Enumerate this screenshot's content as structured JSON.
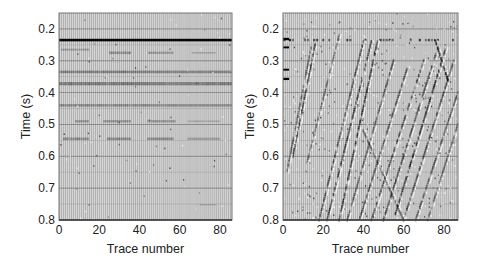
{
  "chart_data": [
    {
      "type": "heatmap",
      "subtype": "seismic-wiggle-section",
      "title": "",
      "xlabel": "Trace number",
      "ylabel": "Time (s)",
      "xlim": [
        0,
        86
      ],
      "ylim": [
        0.15,
        0.8
      ],
      "y_inverted": true,
      "xticks": [
        0,
        20,
        40,
        60,
        80
      ],
      "xtick_labels": [
        "0",
        "20",
        "40",
        "60",
        "80"
      ],
      "yticks": [
        0.2,
        0.3,
        0.4,
        0.5,
        0.6,
        0.7,
        0.8
      ],
      "ytick_labels": [
        "0.2",
        "0.3",
        "0.4",
        "0.5",
        "0.6",
        "0.7",
        "0.8"
      ],
      "grid": true,
      "description": "Flat (horizontal) reflection events",
      "events": [
        {
          "kind": "horizontal",
          "t": 0.235,
          "x0": 0,
          "x1": 86,
          "strength": 1.0,
          "thickness": 0.008
        },
        {
          "kind": "horizontal",
          "t": 0.265,
          "x0": 1,
          "x1": 15,
          "strength": 0.45,
          "thickness": 0.006
        },
        {
          "kind": "horizontal",
          "t": 0.275,
          "x0": 25,
          "x1": 36,
          "strength": 0.55,
          "thickness": 0.008
        },
        {
          "kind": "horizontal",
          "t": 0.275,
          "x0": 44,
          "x1": 57,
          "strength": 0.5,
          "thickness": 0.007
        },
        {
          "kind": "horizontal",
          "t": 0.275,
          "x0": 66,
          "x1": 78,
          "strength": 0.35,
          "thickness": 0.005
        },
        {
          "kind": "horizontal",
          "t": 0.335,
          "x0": 0,
          "x1": 86,
          "strength": 0.7,
          "thickness": 0.008
        },
        {
          "kind": "horizontal",
          "t": 0.372,
          "x0": 0,
          "x1": 86,
          "strength": 0.75,
          "thickness": 0.01
        },
        {
          "kind": "horizontal",
          "t": 0.44,
          "x0": 0,
          "x1": 86,
          "strength": 0.6,
          "thickness": 0.008
        },
        {
          "kind": "horizontal",
          "t": 0.49,
          "x0": 8,
          "x1": 15,
          "strength": 0.55,
          "thickness": 0.007
        },
        {
          "kind": "horizontal",
          "t": 0.49,
          "x0": 22,
          "x1": 36,
          "strength": 0.55,
          "thickness": 0.007
        },
        {
          "kind": "horizontal",
          "t": 0.49,
          "x0": 44,
          "x1": 58,
          "strength": 0.55,
          "thickness": 0.007
        },
        {
          "kind": "horizontal",
          "t": 0.49,
          "x0": 64,
          "x1": 80,
          "strength": 0.35,
          "thickness": 0.005
        },
        {
          "kind": "horizontal",
          "t": 0.545,
          "x0": 2,
          "x1": 15,
          "strength": 0.6,
          "thickness": 0.008
        },
        {
          "kind": "horizontal",
          "t": 0.545,
          "x0": 24,
          "x1": 36,
          "strength": 0.6,
          "thickness": 0.008
        },
        {
          "kind": "horizontal",
          "t": 0.545,
          "x0": 44,
          "x1": 57,
          "strength": 0.6,
          "thickness": 0.008
        },
        {
          "kind": "horizontal",
          "t": 0.545,
          "x0": 64,
          "x1": 80,
          "strength": 0.45,
          "thickness": 0.007
        },
        {
          "kind": "horizontal",
          "t": 0.752,
          "x0": 70,
          "x1": 78,
          "strength": 0.35,
          "thickness": 0.004
        }
      ]
    },
    {
      "type": "heatmap",
      "subtype": "seismic-wiggle-section",
      "title": "",
      "xlabel": "Trace number",
      "ylabel": "Time (s)",
      "xlim": [
        0,
        87
      ],
      "ylim": [
        0.15,
        0.8
      ],
      "y_inverted": true,
      "xticks": [
        0,
        20,
        40,
        60,
        80
      ],
      "xtick_labels": [
        "0",
        "20",
        "40",
        "60",
        "80"
      ],
      "yticks": [
        0.2,
        0.3,
        0.4,
        0.5,
        0.6,
        0.7,
        0.8
      ],
      "ytick_labels": [
        "0.2",
        "0.3",
        "0.4",
        "0.5",
        "0.6",
        "0.7",
        "0.8"
      ],
      "grid": true,
      "description": "Dipping (linear) coherent noise events with flat first break near 0.235 s",
      "events": [
        {
          "kind": "horizontal",
          "t": 0.235,
          "x0": 0,
          "x1": 87,
          "strength": 0.55,
          "thickness": 0.005,
          "dotted": true
        },
        {
          "kind": "horizontal",
          "t": 0.232,
          "x0": 0,
          "x1": 3,
          "strength": 1.0,
          "thickness": 0.008
        },
        {
          "kind": "horizontal",
          "t": 0.258,
          "x0": 0,
          "x1": 3,
          "strength": 1.0,
          "thickness": 0.006
        },
        {
          "kind": "horizontal",
          "t": 0.328,
          "x0": 0,
          "x1": 3,
          "strength": 1.0,
          "thickness": 0.006
        },
        {
          "kind": "horizontal",
          "t": 0.357,
          "x0": 0,
          "x1": 3,
          "strength": 1.0,
          "thickness": 0.007
        },
        {
          "kind": "dip",
          "x0": 16,
          "t0": 0.25,
          "x1": 5,
          "t1": 0.6,
          "strength": 0.6
        },
        {
          "kind": "dip",
          "x0": 14,
          "t0": 0.26,
          "x1": 2,
          "t1": 0.65,
          "strength": 0.45
        },
        {
          "kind": "dip",
          "x0": 28,
          "t0": 0.22,
          "x1": 12,
          "t1": 0.62,
          "strength": 0.4
        },
        {
          "kind": "dip",
          "x0": 40,
          "t0": 0.24,
          "x1": 18,
          "t1": 0.8,
          "strength": 0.55
        },
        {
          "kind": "dip",
          "x0": 44,
          "t0": 0.24,
          "x1": 22,
          "t1": 0.8,
          "strength": 0.6
        },
        {
          "kind": "dip",
          "x0": 47,
          "t0": 0.24,
          "x1": 28,
          "t1": 0.8,
          "strength": 0.65
        },
        {
          "kind": "dip",
          "x0": 55,
          "t0": 0.3,
          "x1": 32,
          "t1": 0.8,
          "strength": 0.5
        },
        {
          "kind": "dip",
          "x0": 62,
          "t0": 0.32,
          "x1": 38,
          "t1": 0.8,
          "strength": 0.5
        },
        {
          "kind": "dip",
          "x0": 70,
          "t0": 0.3,
          "x1": 44,
          "t1": 0.8,
          "strength": 0.55
        },
        {
          "kind": "dip",
          "x0": 76,
          "t0": 0.28,
          "x1": 50,
          "t1": 0.8,
          "strength": 0.6
        },
        {
          "kind": "dip",
          "x0": 81,
          "t0": 0.26,
          "x1": 56,
          "t1": 0.78,
          "strength": 0.7
        },
        {
          "kind": "dip",
          "x0": 85,
          "t0": 0.3,
          "x1": 60,
          "t1": 0.8,
          "strength": 0.55
        },
        {
          "kind": "dip",
          "x0": 87,
          "t0": 0.4,
          "x1": 66,
          "t1": 0.8,
          "strength": 0.5
        },
        {
          "kind": "dip",
          "x0": 87,
          "t0": 0.5,
          "x1": 72,
          "t1": 0.8,
          "strength": 0.45
        },
        {
          "kind": "dip",
          "x0": 40,
          "t0": 0.52,
          "x1": 60,
          "t1": 0.8,
          "strength": 0.45
        },
        {
          "kind": "dip",
          "x0": 76,
          "t0": 0.24,
          "x1": 82,
          "t1": 0.36,
          "strength": 0.8
        }
      ]
    }
  ],
  "panels": [
    {
      "id": "left",
      "ylabel": "Time (s)",
      "xlabel": "Trace number"
    },
    {
      "id": "right",
      "ylabel": "Time (s)",
      "xlabel": "Trace number"
    }
  ]
}
